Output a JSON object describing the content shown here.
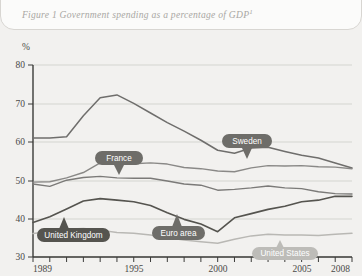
{
  "figure": {
    "label": "Figure 1",
    "title": "Figure 1 Government spending as a percentage of GDP",
    "footnote_marker": "1"
  },
  "axes": {
    "y_unit": "%",
    "y_ticks": [
      "80",
      "70",
      "60",
      "50",
      "40",
      "30"
    ],
    "x_ticks_labeled": [
      "1989",
      "1995",
      "2000",
      "2005",
      "2008"
    ]
  },
  "callouts": [
    {
      "name": "france",
      "label": "France"
    },
    {
      "name": "sweden",
      "label": "Sweden"
    },
    {
      "name": "united-kingdom",
      "label": "United Kingdom"
    },
    {
      "name": "euro-area",
      "label": "Euro area"
    },
    {
      "name": "united-states",
      "label": "United States"
    }
  ],
  "colors": {
    "sweden": "#6f6e6c",
    "france": "#8a8987",
    "euro_area": "#7b7a78",
    "united_kingdom": "#55544f",
    "united_states": "#b9b8b4",
    "callout_dark": "#6e6d69",
    "callout_light": "#bdbcb8",
    "grid": "#c9c8c4",
    "axis": "#3b3b39",
    "background": "#f2f1ef"
  },
  "chart_data": {
    "type": "line",
    "title": "Government spending as a percentage of GDP",
    "xlabel": "",
    "ylabel": "%",
    "ylim": [
      30,
      80
    ],
    "xlim": [
      1989,
      2008
    ],
    "grid": true,
    "legend": "inline-callouts",
    "x": [
      1989,
      1990,
      1991,
      1992,
      1993,
      1994,
      1995,
      1996,
      1997,
      1998,
      1999,
      2000,
      2001,
      2002,
      2003,
      2004,
      2005,
      2006,
      2007,
      2008
    ],
    "series": [
      {
        "name": "Sweden",
        "values": [
          61.0,
          61.0,
          61.3,
          66.8,
          71.5,
          72.2,
          70.0,
          67.5,
          65.0,
          62.8,
          60.4,
          57.8,
          57.0,
          58.4,
          58.6,
          57.5,
          56.5,
          55.8,
          54.5,
          53.2
        ]
      },
      {
        "name": "France",
        "values": [
          49.5,
          49.6,
          50.6,
          52.0,
          54.5,
          54.4,
          54.3,
          54.5,
          54.2,
          53.3,
          53.0,
          52.4,
          52.2,
          53.2,
          53.8,
          53.7,
          53.8,
          53.5,
          53.4,
          53.0
        ]
      },
      {
        "name": "Euro area",
        "values": [
          49.0,
          48.4,
          50.0,
          50.7,
          51.0,
          50.6,
          50.5,
          50.5,
          49.8,
          49.0,
          48.7,
          47.4,
          47.6,
          48.0,
          48.5,
          48.0,
          47.8,
          47.0,
          46.5,
          46.4
        ]
      },
      {
        "name": "United Kingdom",
        "values": [
          39.0,
          40.5,
          42.5,
          44.6,
          45.2,
          44.8,
          44.4,
          43.4,
          41.5,
          39.8,
          38.6,
          36.6,
          40.2,
          41.3,
          42.4,
          43.2,
          44.4,
          44.8,
          45.8,
          45.8
        ]
      },
      {
        "name": "United States",
        "values": [
          36.1,
          36.6,
          37.2,
          37.4,
          37.0,
          36.4,
          36.2,
          35.7,
          35.0,
          34.4,
          34.0,
          33.6,
          34.6,
          35.5,
          35.9,
          35.7,
          35.7,
          35.6,
          35.9,
          36.2
        ]
      }
    ]
  }
}
